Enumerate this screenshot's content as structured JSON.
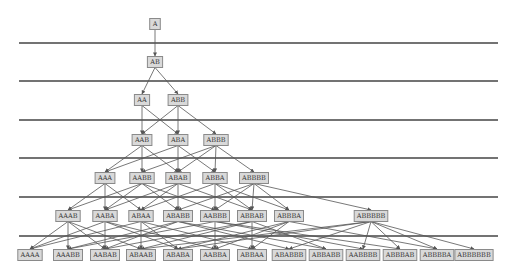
{
  "diagram": {
    "title": "",
    "colors": {
      "background": "#ffffff",
      "node_fill": "#d9d9d9",
      "node_border": "#8a8a8a",
      "edge": "#555555",
      "separator": "#444444",
      "text": "#333333"
    },
    "separators_y": [
      43,
      81,
      120,
      158,
      197,
      236
    ],
    "separator_x": [
      19,
      498
    ],
    "levels": [
      {
        "y": 24,
        "nodes": [
          {
            "id": "A",
            "label": "A",
            "x": 155
          }
        ]
      },
      {
        "y": 62,
        "nodes": [
          {
            "id": "AB",
            "label": "AB",
            "x": 155
          }
        ]
      },
      {
        "y": 100,
        "nodes": [
          {
            "id": "AA",
            "label": "AA",
            "x": 142
          },
          {
            "id": "ABB",
            "label": "ABB",
            "x": 178
          }
        ]
      },
      {
        "y": 140,
        "nodes": [
          {
            "id": "AAB",
            "label": "AAB",
            "x": 142
          },
          {
            "id": "ABA",
            "label": "ABA",
            "x": 178
          },
          {
            "id": "ABBB",
            "label": "ABBB",
            "x": 216
          }
        ]
      },
      {
        "y": 178,
        "nodes": [
          {
            "id": "AAA",
            "label": "AAA",
            "x": 105
          },
          {
            "id": "AABB",
            "label": "AABB",
            "x": 142
          },
          {
            "id": "ABAB",
            "label": "ABAB",
            "x": 178
          },
          {
            "id": "ABBA",
            "label": "ABBA",
            "x": 215
          },
          {
            "id": "ABBBB",
            "label": "ABBBB",
            "x": 254
          }
        ]
      },
      {
        "y": 216,
        "nodes": [
          {
            "id": "AAAB",
            "label": "AAAB",
            "x": 68
          },
          {
            "id": "AABA",
            "label": "AABA",
            "x": 105
          },
          {
            "id": "ABAA",
            "label": "ABAA",
            "x": 141
          },
          {
            "id": "ABABB",
            "label": "ABABB",
            "x": 178
          },
          {
            "id": "AABBB",
            "label": "AABBB",
            "x": 215
          },
          {
            "id": "ABBAB",
            "label": "ABBAB",
            "x": 252
          },
          {
            "id": "ABBBA",
            "label": "ABBBA",
            "x": 289
          },
          {
            "id": "ABBBBB",
            "label": "ABBBBB",
            "x": 371
          }
        ]
      },
      {
        "y": 255,
        "nodes": [
          {
            "id": "AAAA",
            "label": "AAAA",
            "x": 30
          },
          {
            "id": "AAABB",
            "label": "AAABB",
            "x": 68
          },
          {
            "id": "AABAB",
            "label": "AABAB",
            "x": 105
          },
          {
            "id": "ABAAB",
            "label": "ABAAB",
            "x": 141
          },
          {
            "id": "ABABA",
            "label": "ABABA",
            "x": 178
          },
          {
            "id": "AABBA",
            "label": "AABBA",
            "x": 215
          },
          {
            "id": "ABBAA",
            "label": "ABBAA",
            "x": 252
          },
          {
            "id": "ABABBB",
            "label": "ABABBB",
            "x": 289
          },
          {
            "id": "ABBABB",
            "label": "ABBABB",
            "x": 326
          },
          {
            "id": "AABBBB",
            "label": "AABBBB",
            "x": 363
          },
          {
            "id": "ABBBAB",
            "label": "ABBBAB",
            "x": 400
          },
          {
            "id": "ABBBBA",
            "label": "ABBBBA",
            "x": 437
          },
          {
            "id": "ABBBBBB",
            "label": "ABBBBBB",
            "x": 474
          }
        ]
      }
    ],
    "edges": [
      [
        "A",
        "AB"
      ],
      [
        "AB",
        "AA"
      ],
      [
        "AB",
        "ABB"
      ],
      [
        "AA",
        "AAB"
      ],
      [
        "AA",
        "ABA"
      ],
      [
        "ABB",
        "AAB"
      ],
      [
        "ABB",
        "ABA"
      ],
      [
        "ABB",
        "ABBB"
      ],
      [
        "AAB",
        "AAA"
      ],
      [
        "AAB",
        "AABB"
      ],
      [
        "AAB",
        "ABAB"
      ],
      [
        "ABA",
        "AAA"
      ],
      [
        "ABA",
        "ABAB"
      ],
      [
        "ABA",
        "ABBA"
      ],
      [
        "ABBB",
        "AABB"
      ],
      [
        "ABBB",
        "ABAB"
      ],
      [
        "ABBB",
        "ABBA"
      ],
      [
        "ABBB",
        "ABBBB"
      ],
      [
        "AAA",
        "AAAB"
      ],
      [
        "AAA",
        "AABA"
      ],
      [
        "AAA",
        "ABAA"
      ],
      [
        "AABB",
        "AAAB"
      ],
      [
        "AABB",
        "AABA"
      ],
      [
        "AABB",
        "ABABB"
      ],
      [
        "AABB",
        "AABBB"
      ],
      [
        "ABAB",
        "AABA"
      ],
      [
        "ABAB",
        "ABAA"
      ],
      [
        "ABAB",
        "ABABB"
      ],
      [
        "ABAB",
        "ABBAB"
      ],
      [
        "ABBA",
        "ABAA"
      ],
      [
        "ABBA",
        "AABBB"
      ],
      [
        "ABBA",
        "ABBAB"
      ],
      [
        "ABBA",
        "ABBBA"
      ],
      [
        "ABBBB",
        "AABBB"
      ],
      [
        "ABBBB",
        "ABABB"
      ],
      [
        "ABBBB",
        "ABBAB"
      ],
      [
        "ABBBB",
        "ABBBA"
      ],
      [
        "ABBBB",
        "ABBBBB"
      ],
      [
        "AAAB",
        "AAAA"
      ],
      [
        "AAAB",
        "AAABB"
      ],
      [
        "AAAB",
        "AABAB"
      ],
      [
        "AAAB",
        "ABAAB"
      ],
      [
        "AABA",
        "AAAA"
      ],
      [
        "AABA",
        "AABAB"
      ],
      [
        "AABA",
        "ABABA"
      ],
      [
        "AABA",
        "AABBA"
      ],
      [
        "ABAA",
        "AAAA"
      ],
      [
        "ABAA",
        "ABAAB"
      ],
      [
        "ABAA",
        "ABABA"
      ],
      [
        "ABAA",
        "ABBAA"
      ],
      [
        "ABABB",
        "AAABB"
      ],
      [
        "ABABB",
        "AABAB"
      ],
      [
        "ABABB",
        "ABABBB"
      ],
      [
        "ABABB",
        "ABBABB"
      ],
      [
        "AABBB",
        "AAABB"
      ],
      [
        "AABBB",
        "AABBA"
      ],
      [
        "AABBB",
        "AABBBB"
      ],
      [
        "AABBB",
        "ABBBAB"
      ],
      [
        "ABBAB",
        "AABAB"
      ],
      [
        "ABBAB",
        "ABAAB"
      ],
      [
        "ABBAB",
        "ABBAA"
      ],
      [
        "ABBAB",
        "ABBABB"
      ],
      [
        "ABBBA",
        "ABABA"
      ],
      [
        "ABBBA",
        "AABBA"
      ],
      [
        "ABBBA",
        "ABBAA"
      ],
      [
        "ABBBA",
        "ABBBBA"
      ],
      [
        "ABBBBB",
        "ABAAB"
      ],
      [
        "ABBBBB",
        "ABABA"
      ],
      [
        "ABBBBB",
        "ABABBB"
      ],
      [
        "ABBBBB",
        "AABBBB"
      ],
      [
        "ABBBBB",
        "ABBBAB"
      ],
      [
        "ABBBBB",
        "ABBBBA"
      ],
      [
        "ABBBBB",
        "ABBBBBB"
      ]
    ]
  }
}
